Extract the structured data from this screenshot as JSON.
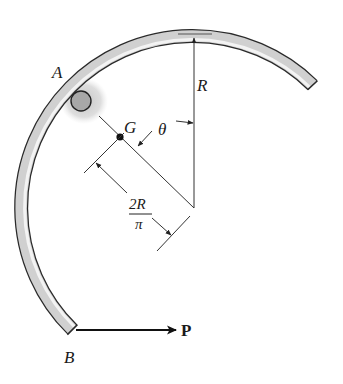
{
  "diagram": {
    "labels": {
      "point_a": "A",
      "point_b": "B",
      "centroid": "G",
      "radius": "R",
      "angle": "θ",
      "force": "P",
      "dim_numerator": "2R",
      "dim_denominator": "π"
    },
    "colors": {
      "rod_fill": "#d4d4d4",
      "rod_highlight": "#f2f2f2",
      "rod_outline": "#2a2a2a",
      "line": "#333333",
      "shadow": "#c8c8c8",
      "pin": "#a8a8a8"
    }
  }
}
